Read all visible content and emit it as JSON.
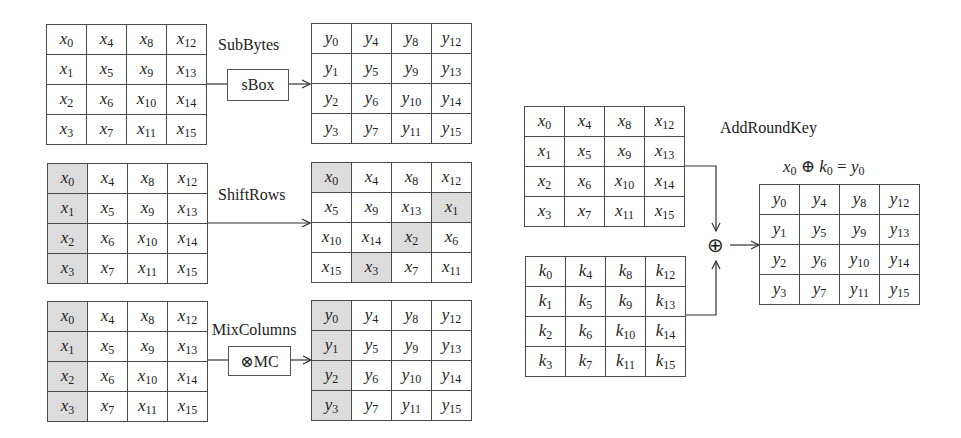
{
  "diagram": {
    "colors": {
      "border": "#4a4a4a",
      "shaded": "#dcdcdc",
      "line": "#333333"
    },
    "sub_bytes": {
      "label": "SubBytes",
      "op_label": "sBox",
      "input": [
        [
          "x",
          "0",
          "x",
          "4",
          "x",
          "8",
          "x",
          "12"
        ],
        [
          "x",
          "1",
          "x",
          "5",
          "x",
          "9",
          "x",
          "13"
        ],
        [
          "x",
          "2",
          "x",
          "6",
          "x",
          "10",
          "x",
          "14"
        ],
        [
          "x",
          "3",
          "x",
          "7",
          "x",
          "11",
          "x",
          "15"
        ]
      ],
      "input_cells": [
        [
          "x0",
          "x4",
          "x8",
          "x12"
        ],
        [
          "x1",
          "x5",
          "x9",
          "x13"
        ],
        [
          "x2",
          "x6",
          "x10",
          "x14"
        ],
        [
          "x3",
          "x7",
          "x11",
          "x15"
        ]
      ],
      "output_cells": [
        [
          "y0",
          "y4",
          "y8",
          "y12"
        ],
        [
          "y1",
          "y5",
          "y9",
          "y13"
        ],
        [
          "y2",
          "y6",
          "y10",
          "y14"
        ],
        [
          "y3",
          "y7",
          "y11",
          "y15"
        ]
      ],
      "shaded_input": [],
      "shaded_output": []
    },
    "shift_rows": {
      "label": "ShiftRows",
      "input_cells": [
        [
          "x0",
          "x4",
          "x8",
          "x12"
        ],
        [
          "x1",
          "x5",
          "x9",
          "x13"
        ],
        [
          "x2",
          "x6",
          "x10",
          "x14"
        ],
        [
          "x3",
          "x7",
          "x11",
          "x15"
        ]
      ],
      "output_cells": [
        [
          "x0",
          "x4",
          "x8",
          "x12"
        ],
        [
          "x5",
          "x9",
          "x13",
          "x1"
        ],
        [
          "x10",
          "x14",
          "x2",
          "x6"
        ],
        [
          "x15",
          "x3",
          "x7",
          "x11"
        ]
      ],
      "shaded_input": [
        "0,0",
        "1,0",
        "2,0",
        "3,0"
      ],
      "shaded_output": [
        "0,0",
        "1,3",
        "2,2",
        "3,1"
      ]
    },
    "mix_columns": {
      "label": "MixColumns",
      "op_label": "⊗MC",
      "input_cells": [
        [
          "x0",
          "x4",
          "x8",
          "x12"
        ],
        [
          "x1",
          "x5",
          "x9",
          "x13"
        ],
        [
          "x2",
          "x6",
          "x10",
          "x14"
        ],
        [
          "x3",
          "x7",
          "x11",
          "x15"
        ]
      ],
      "output_cells": [
        [
          "y0",
          "y4",
          "y8",
          "y12"
        ],
        [
          "y1",
          "y5",
          "y9",
          "y13"
        ],
        [
          "y2",
          "y6",
          "y10",
          "y14"
        ],
        [
          "y3",
          "y7",
          "y11",
          "y15"
        ]
      ],
      "shaded_input": [
        "0,0",
        "1,0",
        "2,0",
        "3,0"
      ],
      "shaded_output": [
        "0,0",
        "1,0",
        "2,0",
        "3,0"
      ]
    },
    "add_round_key": {
      "label": "AddRoundKey",
      "equation": {
        "a": "x",
        "a_sub": "0",
        "op": "⊕",
        "b": "k",
        "b_sub": "0",
        "eq": "=",
        "c": "y",
        "c_sub": "0"
      },
      "xor_symbol": "⊕",
      "state_cells": [
        [
          "x0",
          "x4",
          "x8",
          "x12"
        ],
        [
          "x1",
          "x5",
          "x9",
          "x13"
        ],
        [
          "x2",
          "x6",
          "x10",
          "x14"
        ],
        [
          "x3",
          "x7",
          "x11",
          "x15"
        ]
      ],
      "key_cells": [
        [
          "k0",
          "k4",
          "k8",
          "k12"
        ],
        [
          "k1",
          "k5",
          "k9",
          "k13"
        ],
        [
          "k2",
          "k6",
          "k10",
          "k14"
        ],
        [
          "k3",
          "k7",
          "k11",
          "k15"
        ]
      ],
      "output_cells": [
        [
          "y0",
          "y4",
          "y8",
          "y12"
        ],
        [
          "y1",
          "y5",
          "y9",
          "y13"
        ],
        [
          "y2",
          "y6",
          "y10",
          "y14"
        ],
        [
          "y3",
          "y7",
          "y11",
          "y15"
        ]
      ]
    }
  }
}
